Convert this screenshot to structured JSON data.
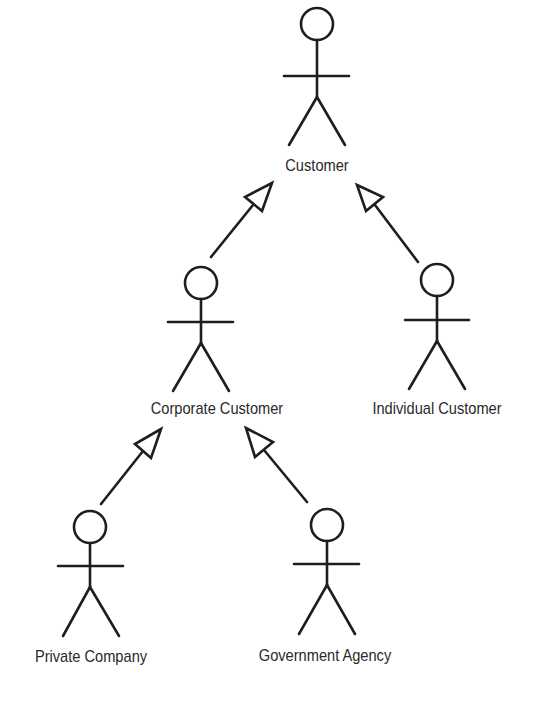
{
  "diagram": {
    "type": "UML use-case actor generalization hierarchy",
    "stroke_color": "#1e1e1e",
    "text_color": "#2a2a2a",
    "background": "#ffffff",
    "actors": [
      {
        "id": "customer",
        "label": "Customer",
        "x": 317,
        "head_y": 24,
        "label_y": 156
      },
      {
        "id": "corporate",
        "label": "Corporate Customer",
        "x": 201,
        "head_y": 282,
        "label_y": 399,
        "label_x": 217
      },
      {
        "id": "individual",
        "label": "Individual Customer",
        "x": 436,
        "head_y": 280,
        "label_y": 399,
        "label_x": 437
      },
      {
        "id": "private",
        "label": "Private Company",
        "x": 90,
        "head_y": 527,
        "label_y": 647,
        "label_x": 91
      },
      {
        "id": "government",
        "label": "Government Agency",
        "x": 327,
        "head_y": 525,
        "label_y": 646,
        "label_x": 325
      }
    ],
    "generalizations": [
      {
        "from": "Corporate Customer",
        "to": "Customer"
      },
      {
        "from": "Individual Customer",
        "to": "Customer"
      },
      {
        "from": "Private Company",
        "to": "Corporate Customer"
      },
      {
        "from": "Government Agency",
        "to": "Corporate Customer"
      }
    ]
  }
}
